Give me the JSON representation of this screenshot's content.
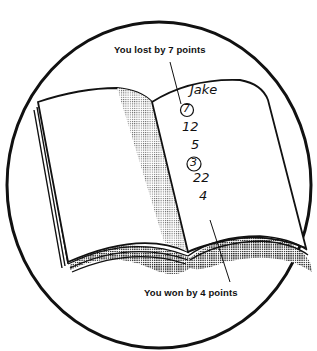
{
  "illustration": {
    "subject": "open notebook with handwritten scores",
    "colors": {
      "ink": "#111111",
      "paper": "#ffffff",
      "shading": "#9a9a9a"
    }
  },
  "callouts": {
    "top": "You lost by 7 points",
    "bottom": "You won by 4 points"
  },
  "page": {
    "name": "Jake",
    "name_as_written": "Jake",
    "scores": [
      {
        "value": "7",
        "circled": true
      },
      {
        "value": "12",
        "circled": false
      },
      {
        "value": "5",
        "circled": false
      },
      {
        "value": "3",
        "circled": true
      },
      {
        "value": "22",
        "circled": false
      },
      {
        "value": "4",
        "circled": false
      }
    ]
  }
}
